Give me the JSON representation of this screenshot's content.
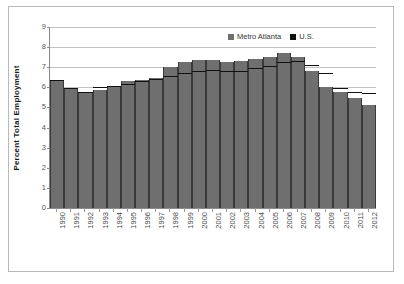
{
  "chart_data": {
    "type": "bar",
    "title": "",
    "xlabel": "",
    "ylabel": "Percent Total Employment",
    "ylim": [
      0,
      9
    ],
    "ytick_values": [
      0,
      1,
      2,
      3,
      4,
      5,
      6,
      7,
      8,
      9
    ],
    "ytick_labels": [
      "0",
      "1",
      "2",
      "3",
      "4",
      "5",
      "6",
      "7",
      "8",
      "9"
    ],
    "grid": true,
    "legend_position": "top-right",
    "categories": [
      "1990",
      "1991",
      "1992",
      "1993",
      "1994",
      "1995",
      "1996",
      "1997",
      "1998",
      "1999",
      "2000",
      "2001",
      "2002",
      "2003",
      "2004",
      "2005",
      "2006",
      "2007",
      "2008",
      "2009",
      "2010",
      "2011",
      "2012"
    ],
    "series": [
      {
        "name": "Metro Atlanta",
        "color": "#6f6f6f",
        "render": "bar",
        "values": [
          6.35,
          5.95,
          5.7,
          5.85,
          6.0,
          6.3,
          6.35,
          6.45,
          7.0,
          7.25,
          7.35,
          7.35,
          7.25,
          7.3,
          7.4,
          7.5,
          7.7,
          7.5,
          6.8,
          6.0,
          5.75,
          5.45,
          5.1
        ]
      },
      {
        "name": "U.S.",
        "color": "#111111",
        "render": "step-outline",
        "values": [
          6.35,
          5.95,
          5.75,
          6.0,
          6.05,
          6.15,
          6.3,
          6.4,
          6.55,
          6.7,
          6.8,
          6.85,
          6.8,
          6.8,
          6.95,
          7.05,
          7.25,
          7.3,
          7.1,
          6.7,
          5.95,
          5.75,
          5.7
        ]
      }
    ]
  },
  "legend": {
    "items": [
      {
        "label": "Metro Atlanta",
        "color": "#6f6f6f"
      },
      {
        "label": "U.S.",
        "color": "#111111"
      }
    ]
  }
}
